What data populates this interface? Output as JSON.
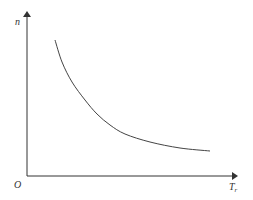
{
  "chart_data": {
    "type": "line",
    "title": "",
    "xlabel": "T",
    "xlabel_subscript": "r",
    "ylabel": "n",
    "origin_label": "O",
    "grid": false,
    "legend": null,
    "ticks": [],
    "series": [
      {
        "name": "n vs T_r",
        "description": "monotonically decreasing convex curve approaching a horizontal asymptote",
        "points_px": [
          [
            55,
            40
          ],
          [
            62,
            62
          ],
          [
            72,
            82
          ],
          [
            85,
            100
          ],
          [
            97,
            114
          ],
          [
            110,
            125
          ],
          [
            125,
            134
          ],
          [
            150,
            142
          ],
          [
            180,
            148
          ],
          [
            210,
            151
          ]
        ]
      }
    ],
    "colors": {
      "axis": "#333333",
      "curve": "#444444"
    }
  }
}
